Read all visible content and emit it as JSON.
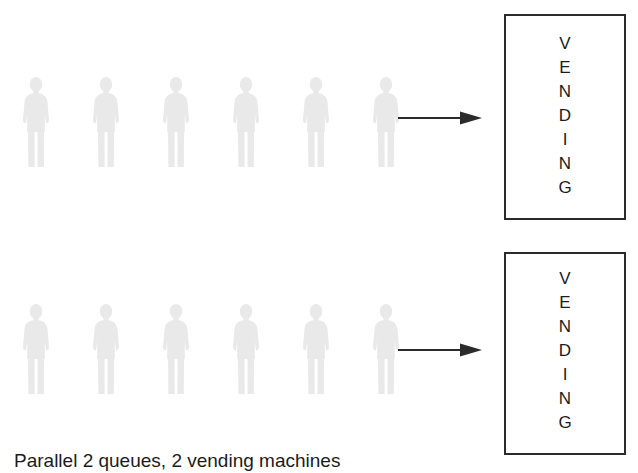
{
  "background_color": "#ffffff",
  "figure_color": "#e9e9e9",
  "line_color": "#2b2b2b",
  "text_color": "#1c1c1c",
  "caption": {
    "text": "Parallel 2 queues, 2 vending machines"
  },
  "queues": [
    {
      "id": "queue-top",
      "person_count": 6,
      "people": [
        {
          "label": "person"
        },
        {
          "label": "person"
        },
        {
          "label": "person"
        },
        {
          "label": "person"
        },
        {
          "label": "person"
        },
        {
          "label": "person"
        }
      ],
      "arrow": {
        "direction": "right",
        "label": "flow-arrow"
      }
    },
    {
      "id": "queue-bottom",
      "person_count": 6,
      "people": [
        {
          "label": "person"
        },
        {
          "label": "person"
        },
        {
          "label": "person"
        },
        {
          "label": "person"
        },
        {
          "label": "person"
        },
        {
          "label": "person"
        }
      ],
      "arrow": {
        "direction": "right",
        "label": "flow-arrow"
      }
    }
  ],
  "vending_machines": [
    {
      "id": "vending-1",
      "label": "VENDING",
      "letters": [
        "V",
        "E",
        "N",
        "D",
        "I",
        "N",
        "G"
      ]
    },
    {
      "id": "vending-2",
      "label": "VENDING",
      "letters": [
        "V",
        "E",
        "N",
        "D",
        "I",
        "N",
        "G"
      ]
    }
  ]
}
